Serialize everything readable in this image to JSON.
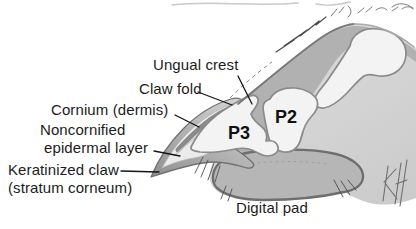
{
  "figure": {
    "labels": {
      "ungual_crest": "Ungual crest",
      "claw_fold": "Claw fold",
      "cornium": "Cornium (dermis)",
      "noncornified_line1": "Noncornified",
      "noncornified_line2": "epidermal layer",
      "keratinized_line1": "Keratinized claw",
      "keratinized_line2": "(stratum corneum)",
      "digital_pad": "Digital pad",
      "p3": "P3",
      "p2": "P2"
    },
    "signature_monogram": "KH",
    "colors": {
      "label_text": "#1c1c1c",
      "body_light": "#dcdcdc",
      "body_shade": "#cbcbcb",
      "deep_tissue": "#b1b1b1",
      "bone_fill": "#f3f3f3",
      "pad_fill": "#b6b6b6",
      "claw_dark": "#8f8f8f",
      "claw_light": "#d2d2d2",
      "claw_inner": "#ebebeb",
      "dermis_band": "#8a8a8a",
      "outline": "#787878"
    }
  }
}
